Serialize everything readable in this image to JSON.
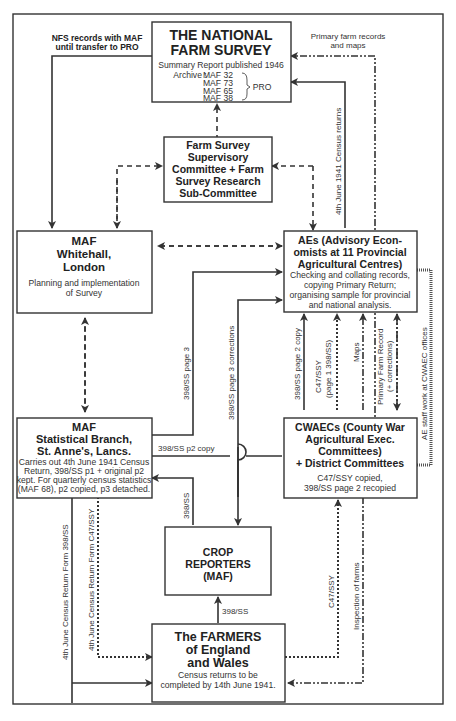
{
  "nodes": {
    "nfs": {
      "title_line1": "THE NATIONAL",
      "title_line2": "FARM SURVEY",
      "summary": "Summary Report published 1946",
      "archive_label": "Archive :",
      "archive_items": [
        "MAF 32",
        "MAF 73",
        "MAF 65",
        "MAF 38"
      ],
      "archive_group": "PRO"
    },
    "committee": {
      "lines": [
        "Farm Survey",
        "Supervisory",
        "Committee + Farm",
        "Survey Research",
        "Sub-Committee"
      ]
    },
    "maf_whitehall": {
      "title_lines": [
        "MAF",
        "Whitehall,",
        "London"
      ],
      "body_lines": [
        "Planning and implementation",
        "of Survey"
      ]
    },
    "aes": {
      "title_lines": [
        "AEs (Advisory Econ-",
        "omists at 11 Provincial",
        "Agricultural Centres)"
      ],
      "body_lines": [
        "Checking and collating records,",
        "copying Primary Return;",
        "organising sample for provincial",
        "and national analysis."
      ]
    },
    "maf_stats": {
      "title_lines": [
        "MAF",
        "Statistical Branch,",
        "St. Anne's, Lancs."
      ],
      "body_lines": [
        "Carries out 4th June 1941 Census",
        "Return, 398/SS p1 + original p2",
        "kept. For quarterly census statistics",
        "(MAF 68), p2 copied, p3 detached."
      ]
    },
    "cwaecs": {
      "title_lines": [
        "CWAECs (County War",
        "Agricultural Exec.",
        "Committees)",
        "+ District Committees"
      ],
      "body_lines": [
        "C47/SSY copied,",
        "398/SS page 2 recopied"
      ]
    },
    "crop_reporters": {
      "title_lines": [
        "CROP",
        "REPORTERS",
        "(MAF)"
      ]
    },
    "farmers": {
      "title_lines": [
        "The FARMERS",
        "of England",
        "and Wales"
      ],
      "body_lines": [
        "Census returns to be",
        "completed by 14th June 1941."
      ]
    }
  },
  "edge_labels": {
    "nfs_records": [
      "NFS records with MAF",
      "until transfer to PRO"
    ],
    "primary_farm_records": [
      "Primary farm records",
      "and maps"
    ],
    "census_returns_1941": "4th June 1941 Census returns",
    "ss398_page3": "398/SS page 3",
    "ss398_page3_corrections": "398/SS page 3 corrections",
    "ss398_p2_copy": "398/SS p2 copy",
    "ss398_page2_copy": "398/SS page 2 copy",
    "c47_page1": [
      "C47/SSY",
      "(page 1 398/SS)"
    ],
    "maps": "Maps",
    "primary_farm_record": [
      "Primary Farm Record",
      "(+ corrections)"
    ],
    "ae_staff": "AE staff work at CWAEC offices",
    "ss398_to_stats": "398/SS",
    "ss398_farmers_crop": "398/SS",
    "census_form_398": "4th June Census Return Form 398/SS",
    "census_form_c47": "4th June Census Return Form C47/SSY",
    "c47_cwaec": "C47/SSY",
    "inspection": "Inspection of farms"
  }
}
